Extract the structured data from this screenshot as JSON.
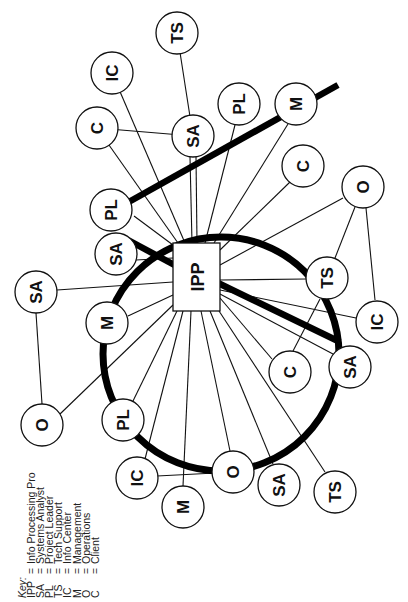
{
  "key": {
    "title": "Key:",
    "entries": [
      {
        "abbr": "IPP",
        "eq": "=",
        "meaning": "Info Processing Pro"
      },
      {
        "abbr": "SA",
        "eq": "=",
        "meaning": "Systems Analyst"
      },
      {
        "abbr": "PL",
        "eq": "=",
        "meaning": "Project Leader"
      },
      {
        "abbr": "TS",
        "eq": "=",
        "meaning": "Tech Support"
      },
      {
        "abbr": "IC",
        "eq": "=",
        "meaning": "Info Center"
      },
      {
        "abbr": "M",
        "eq": "=",
        "meaning": "Management"
      },
      {
        "abbr": "O",
        "eq": "=",
        "meaning": "Operations"
      },
      {
        "abbr": "C",
        "eq": "=",
        "meaning": "Client"
      }
    ]
  },
  "diagram": {
    "center": {
      "label": "IPP"
    },
    "nodes": [
      {
        "id": "n1",
        "label": "TS"
      },
      {
        "id": "n2",
        "label": "IC"
      },
      {
        "id": "n3",
        "label": "C"
      },
      {
        "id": "n4",
        "label": "SA"
      },
      {
        "id": "n5",
        "label": "PL"
      },
      {
        "id": "n6",
        "label": "M"
      },
      {
        "id": "n7",
        "label": "C"
      },
      {
        "id": "n8",
        "label": "O"
      },
      {
        "id": "n9",
        "label": "PL"
      },
      {
        "id": "n10",
        "label": "SA"
      },
      {
        "id": "n11",
        "label": "TS"
      },
      {
        "id": "n12",
        "label": "IC"
      },
      {
        "id": "n13",
        "label": "SA"
      },
      {
        "id": "n14",
        "label": "M"
      },
      {
        "id": "n15",
        "label": "C"
      },
      {
        "id": "n16",
        "label": "SA"
      },
      {
        "id": "n17",
        "label": "O"
      },
      {
        "id": "n18",
        "label": "PL"
      },
      {
        "id": "n19",
        "label": "IC"
      },
      {
        "id": "n20",
        "label": "M"
      },
      {
        "id": "n21",
        "label": "O"
      },
      {
        "id": "n22",
        "label": "SA"
      },
      {
        "id": "n23",
        "label": "TS"
      }
    ]
  }
}
